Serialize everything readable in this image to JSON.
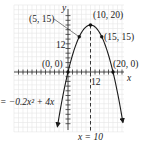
{
  "chart_data": {
    "type": "line",
    "title": "",
    "xlabel": "x",
    "ylabel": "y",
    "equation": "y = -0.2x^2 + 4x",
    "equation_label": "= −0.2x² + 4x",
    "axis_of_symmetry": {
      "label": "x = 10",
      "x": 10
    },
    "tick_labels": {
      "y": [
        "12"
      ],
      "x": [
        "12"
      ]
    },
    "tick_step": 2,
    "xlim": [
      -24,
      24
    ],
    "ylim": [
      -24,
      26
    ],
    "grid": true,
    "series": [
      {
        "name": "y = -0.2x^2 + 4x",
        "function": "-0.2*x*x + 4*x",
        "x_range": [
          -4.7,
          24.4
        ],
        "points": [
          {
            "x": 0,
            "y": 0,
            "label": "(0, 0)"
          },
          {
            "x": 5,
            "y": 15,
            "label": "(5, 15)"
          },
          {
            "x": 10,
            "y": 20,
            "label": "(10, 20)"
          },
          {
            "x": 15,
            "y": 15,
            "label": "(15, 15)"
          },
          {
            "x": 20,
            "y": 0,
            "label": "(20, 0)"
          }
        ]
      }
    ]
  },
  "labels": {
    "y_axis": "y",
    "x_axis": "x",
    "y_tick": "12",
    "x_tick": "12",
    "p0": "(0, 0)",
    "p5": "(5, 15)",
    "p10": "(10, 20)",
    "p15": "(15, 15)",
    "p20": "(20, 0)",
    "equation": "= −0.2x² + 4x",
    "x_eq": "x = 10"
  },
  "colors": {
    "grid": "#e4e4e4",
    "axis": "#333333",
    "curve": "#1a1a1a",
    "text": "#222222"
  }
}
